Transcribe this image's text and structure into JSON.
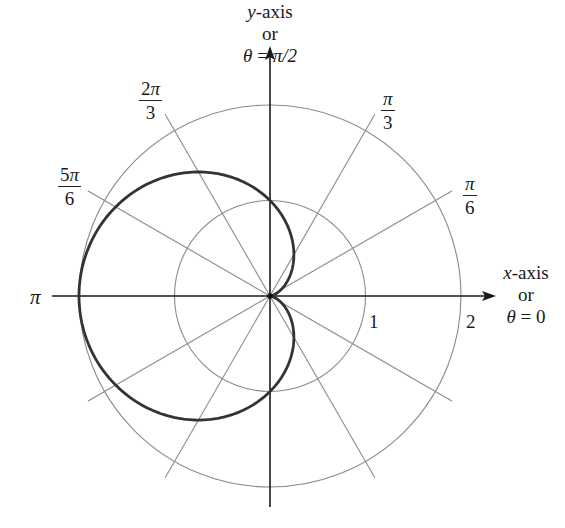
{
  "chart_data": {
    "type": "polar-line",
    "title": "",
    "equation": "r = 1 - cos(theta)",
    "curve_name": "cardioid",
    "center_px": [
      270,
      296
    ],
    "unit_radius_px": 95.5,
    "grid_circles": [
      1,
      2
    ],
    "radial_rays_deg": [
      30,
      60,
      120,
      150,
      210,
      240,
      300,
      330
    ],
    "axes": {
      "x": {
        "label_var": "x",
        "label_suffix": "-axis",
        "or": "or",
        "angle_label": "θ = 0"
      },
      "y": {
        "label_var": "y",
        "label_suffix": "-axis",
        "or": "or",
        "angle_label": "θ = π/2"
      }
    },
    "angle_labels": [
      {
        "id": "pi_6",
        "num_coef": "",
        "num_sym": "π",
        "den": "6"
      },
      {
        "id": "pi_3",
        "num_coef": "",
        "num_sym": "π",
        "den": "3"
      },
      {
        "id": "2pi_3",
        "num_coef": "2",
        "num_sym": "π",
        "den": "3"
      },
      {
        "id": "5pi_6",
        "num_coef": "5",
        "num_sym": "π",
        "den": "6"
      },
      {
        "id": "pi",
        "text": "π"
      }
    ],
    "radius_labels": [
      "1",
      "2"
    ],
    "sample_points": [
      {
        "theta": "0",
        "r": 0
      },
      {
        "theta": "π/3",
        "r": 0.5
      },
      {
        "theta": "π/2",
        "r": 1
      },
      {
        "theta": "2π/3",
        "r": 1.5
      },
      {
        "theta": "π",
        "r": 2
      },
      {
        "theta": "4π/3",
        "r": 1.5
      },
      {
        "theta": "3π/2",
        "r": 1
      },
      {
        "theta": "5π/3",
        "r": 0.5
      }
    ],
    "colors": {
      "curve": "#333333",
      "grid": "#8a8a8a",
      "axis": "#1a1a1a",
      "background": "#ffffff"
    }
  },
  "labels": {
    "y_axis": {
      "var": "y",
      "suffix": "-axis",
      "or": "or",
      "theta": "θ",
      "eq": " = ",
      "val": "π/2"
    },
    "x_axis": {
      "var": "x",
      "suffix": "-axis",
      "or": "or",
      "theta": "θ",
      "eq": " = ",
      "val": "0"
    },
    "pi": "π",
    "r1": "1",
    "r2": "2",
    "pi_3": {
      "num": "π",
      "den": "3"
    },
    "pi_6": {
      "num": "π",
      "den": "6"
    },
    "two_pi_3": {
      "coef": "2",
      "sym": "π",
      "den": "3"
    },
    "five_pi_6": {
      "coef": "5",
      "sym": "π",
      "den": "6"
    }
  }
}
